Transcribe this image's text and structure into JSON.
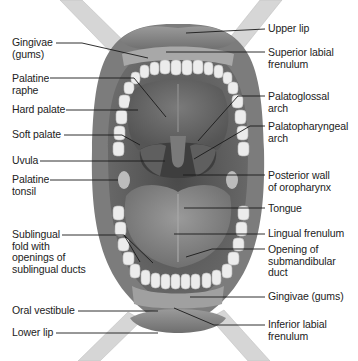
{
  "diagram": {
    "colors": {
      "background": "#ffffff",
      "lip": "#8a8a8a",
      "tissue_dark": "#5a5a5a",
      "palate": "#6e6e6e",
      "tongue": "#8c8c8c",
      "teeth": "#e8e8e8",
      "leader_line": "#1a1a1a",
      "retractor": "#d8d8d8"
    },
    "left_labels": [
      {
        "id": "gingivae-upper",
        "text": "Gingivae\n(gums)"
      },
      {
        "id": "palatine-raphe",
        "text": "Palatine\nraphe"
      },
      {
        "id": "hard-palate",
        "text": "Hard palate"
      },
      {
        "id": "soft-palate",
        "text": "Soft palate"
      },
      {
        "id": "uvula",
        "text": "Uvula"
      },
      {
        "id": "palatine-tonsil",
        "text": "Palatine\ntonsil"
      },
      {
        "id": "sublingual-fold",
        "text": "Sublingual\nfold with\nopenings of\nsublingual ducts"
      },
      {
        "id": "oral-vestibule",
        "text": "Oral vestibule"
      },
      {
        "id": "lower-lip",
        "text": "Lower lip"
      }
    ],
    "right_labels": [
      {
        "id": "upper-lip",
        "text": "Upper lip"
      },
      {
        "id": "superior-labial-frenulum",
        "text": "Superior labial\nfrenulum"
      },
      {
        "id": "palatoglossal-arch",
        "text": "Palatoglossal\narch"
      },
      {
        "id": "palatopharyngeal-arch",
        "text": "Palatopharyngeal\narch"
      },
      {
        "id": "posterior-wall-oropharynx",
        "text": "Posterior wall\nof oropharynx"
      },
      {
        "id": "tongue",
        "text": "Tongue"
      },
      {
        "id": "lingual-frenulum",
        "text": "Lingual frenulum"
      },
      {
        "id": "opening-submandibular-duct",
        "text": "Opening of\nsubmandibular\nduct"
      },
      {
        "id": "gingivae-lower",
        "text": "Gingivae (gums)"
      },
      {
        "id": "inferior-labial-frenulum",
        "text": "Inferior labial\nfrenulum"
      }
    ]
  }
}
